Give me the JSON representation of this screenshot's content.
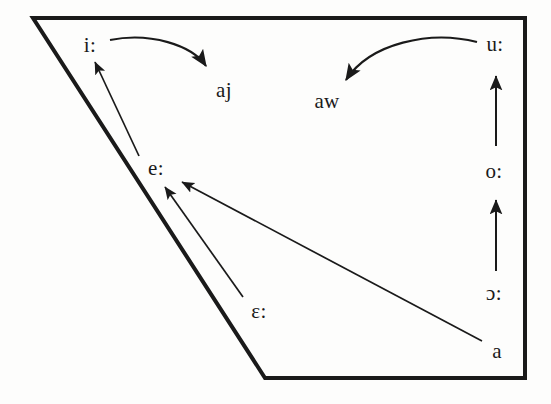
{
  "figure": {
    "type": "vowel-quadrilateral-shift-diagram",
    "background_color": "#fdfdfc",
    "stroke_color": "#1a1a1a"
  },
  "quadrilateral": {
    "name": "vowel-trapezoid",
    "points": "33,18 525,18 525,378 265,378",
    "stroke_width": 4
  },
  "labels": {
    "i_long": "i:",
    "aj": "aj",
    "aw": "aw",
    "u_long": "u:",
    "e_long": "e:",
    "o_long": "o:",
    "eps_long": "ɛ:",
    "open_o_long": "ɔ:",
    "a": "a"
  },
  "label_positions": {
    "i_long": {
      "x": 90,
      "y": 45
    },
    "aj": {
      "x": 224,
      "y": 90
    },
    "aw": {
      "x": 327,
      "y": 101
    },
    "u_long": {
      "x": 495,
      "y": 44
    },
    "e_long": {
      "x": 156,
      "y": 168
    },
    "o_long": {
      "x": 494,
      "y": 171
    },
    "eps_long": {
      "x": 259,
      "y": 311
    },
    "open_o_long": {
      "x": 494,
      "y": 293
    },
    "a": {
      "x": 497,
      "y": 351
    }
  },
  "shifts": [
    {
      "name": "i-to-aj",
      "from": "i:",
      "to": "aj",
      "style": "curved",
      "direction": "rightward-diphthongization"
    },
    {
      "name": "u-to-aw",
      "from": "u:",
      "to": "aw",
      "style": "curved",
      "direction": "leftward-diphthongization"
    },
    {
      "name": "e-to-i",
      "from": "e:",
      "to": "i:",
      "style": "straight",
      "direction": "raising"
    },
    {
      "name": "eps-to-e",
      "from": "ɛ:",
      "to": "e:",
      "style": "straight",
      "direction": "raising"
    },
    {
      "name": "a-to-e",
      "from": "a",
      "to": "e:",
      "style": "straight",
      "direction": "raising-fronting"
    },
    {
      "name": "o-to-u",
      "from": "o:",
      "to": "u:",
      "style": "straight",
      "direction": "raising"
    },
    {
      "name": "open-o-to-o",
      "from": "ɔ:",
      "to": "o:",
      "style": "straight",
      "direction": "raising"
    }
  ]
}
